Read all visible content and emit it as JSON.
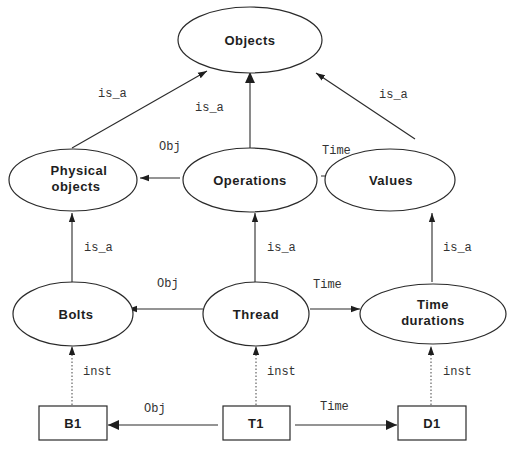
{
  "diagram": {
    "nodes": [
      {
        "id": "objects",
        "label": "Objects",
        "shape": "ellipse"
      },
      {
        "id": "physical_objects",
        "label_line1": "Physical",
        "label_line2": "objects",
        "shape": "ellipse"
      },
      {
        "id": "operations",
        "label": "Operations",
        "shape": "ellipse"
      },
      {
        "id": "values",
        "label": "Values",
        "shape": "ellipse"
      },
      {
        "id": "bolts",
        "label": "Bolts",
        "shape": "ellipse"
      },
      {
        "id": "thread",
        "label": "Thread",
        "shape": "ellipse"
      },
      {
        "id": "time_durations",
        "label_line1": "Time",
        "label_line2": "durations",
        "shape": "ellipse"
      },
      {
        "id": "b1",
        "label": "B1",
        "shape": "rect"
      },
      {
        "id": "t1",
        "label": "T1",
        "shape": "rect"
      },
      {
        "id": "d1",
        "label": "D1",
        "shape": "rect"
      }
    ],
    "edges": [
      {
        "from": "physical_objects",
        "to": "objects",
        "label": "is_a",
        "style": "solid"
      },
      {
        "from": "operations",
        "to": "objects",
        "label": "is_a",
        "style": "solid"
      },
      {
        "from": "values",
        "to": "objects",
        "label": "is_a",
        "style": "solid"
      },
      {
        "from": "operations",
        "to": "physical_objects",
        "label": "Obj",
        "style": "solid"
      },
      {
        "from": "operations",
        "to": "values",
        "label": "Time",
        "style": "solid"
      },
      {
        "from": "bolts",
        "to": "physical_objects",
        "label": "is_a",
        "style": "solid"
      },
      {
        "from": "thread",
        "to": "operations",
        "label": "is_a",
        "style": "solid"
      },
      {
        "from": "time_durations",
        "to": "values",
        "label": "is_a",
        "style": "solid"
      },
      {
        "from": "thread",
        "to": "bolts",
        "label": "Obj",
        "style": "solid"
      },
      {
        "from": "thread",
        "to": "time_durations",
        "label": "Time",
        "style": "solid"
      },
      {
        "from": "b1",
        "to": "bolts",
        "label": "inst",
        "style": "dotted"
      },
      {
        "from": "t1",
        "to": "thread",
        "label": "inst",
        "style": "dotted"
      },
      {
        "from": "d1",
        "to": "time_durations",
        "label": "inst",
        "style": "dotted"
      },
      {
        "from": "t1",
        "to": "b1",
        "label": "Obj",
        "style": "solid"
      },
      {
        "from": "t1",
        "to": "d1",
        "label": "Time",
        "style": "solid"
      }
    ]
  }
}
